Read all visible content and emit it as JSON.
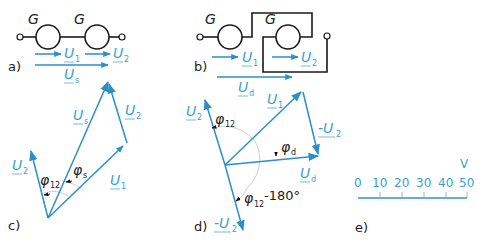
{
  "colors": {
    "vector": "#2a8fc9",
    "label": "#3a9fd0",
    "wire": "#1a1a1a",
    "arc": "#c8c8c8"
  },
  "panels": {
    "a": {
      "label": "a)",
      "generators": [
        "G",
        "G"
      ],
      "arrows": [
        {
          "name": "U",
          "sub": "1"
        },
        {
          "name": "U",
          "sub": "2"
        },
        {
          "name": "U",
          "sub": "s"
        }
      ]
    },
    "b": {
      "label": "b)",
      "generators": [
        "G",
        "G"
      ],
      "arrows": [
        {
          "name": "U",
          "sub": "1"
        },
        {
          "name": "U",
          "sub": "2"
        },
        {
          "name": "U",
          "sub": "d"
        }
      ]
    },
    "c": {
      "label": "c)",
      "vectors": [
        {
          "name": "U",
          "sub": "2"
        },
        {
          "name": "U",
          "sub": "s"
        },
        {
          "name": "U",
          "sub": "1"
        },
        {
          "name": "U",
          "sub": "2"
        }
      ],
      "angles": [
        {
          "sym": "φ",
          "sub": "12"
        },
        {
          "sym": "φ",
          "sub": "s"
        }
      ]
    },
    "d": {
      "label": "d)",
      "vectors": [
        {
          "name": "U",
          "sub": "2"
        },
        {
          "name": "U",
          "sub": "1"
        },
        {
          "name": "-U",
          "sub": "2"
        },
        {
          "name": "U",
          "sub": "d"
        },
        {
          "name": "-U",
          "sub": "2"
        }
      ],
      "angles": [
        {
          "sym": "φ",
          "sub": "12",
          "suffix": ""
        },
        {
          "sym": "φ",
          "sub": "d",
          "suffix": ""
        },
        {
          "sym": "φ",
          "sub": "12",
          "suffix": "-180°"
        }
      ]
    },
    "e": {
      "label": "e)",
      "unit": "V",
      "ticks": [
        "0",
        "10",
        "20",
        "30",
        "40",
        "50"
      ]
    }
  }
}
